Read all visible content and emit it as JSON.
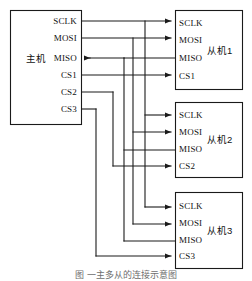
{
  "figure": {
    "caption": "图    一主多从的连接示意图",
    "background_color": "#ffffff",
    "line_color": "#1a1a1a"
  },
  "master": {
    "name": "主机",
    "pins": [
      {
        "id": "sclk",
        "label": "SCLK",
        "direction": "out"
      },
      {
        "id": "mosi",
        "label": "MOSI",
        "direction": "out"
      },
      {
        "id": "miso",
        "label": "MISO",
        "direction": "in"
      },
      {
        "id": "cs1",
        "label": "CS1",
        "direction": "out"
      },
      {
        "id": "cs2",
        "label": "CS2",
        "direction": "out"
      },
      {
        "id": "cs3",
        "label": "CS3",
        "direction": "out"
      }
    ]
  },
  "slaves": [
    {
      "id": "slave1",
      "name": "从机1",
      "pins": [
        {
          "id": "sclk",
          "label": "SCLK",
          "direction": "in"
        },
        {
          "id": "mosi",
          "label": "MOSI",
          "direction": "in"
        },
        {
          "id": "miso",
          "label": "MISO",
          "direction": "out"
        },
        {
          "id": "cs",
          "label": "CS1",
          "direction": "in"
        }
      ]
    },
    {
      "id": "slave2",
      "name": "从机2",
      "pins": [
        {
          "id": "sclk",
          "label": "SCLK",
          "direction": "in"
        },
        {
          "id": "mosi",
          "label": "MOSI",
          "direction": "in"
        },
        {
          "id": "miso",
          "label": "MISO",
          "direction": "out"
        },
        {
          "id": "cs",
          "label": "CS2",
          "direction": "in"
        }
      ]
    },
    {
      "id": "slave3",
      "name": "从机3",
      "pins": [
        {
          "id": "sclk",
          "label": "SCLK",
          "direction": "in"
        },
        {
          "id": "mosi",
          "label": "MOSI",
          "direction": "in"
        },
        {
          "id": "miso",
          "label": "MISO",
          "direction": "out"
        },
        {
          "id": "cs",
          "label": "CS3",
          "direction": "in"
        }
      ]
    }
  ],
  "buses": [
    {
      "id": "sclk-bus",
      "label": "SCLK",
      "from": "master.sclk",
      "to": [
        "slave1.sclk",
        "slave2.sclk",
        "slave3.sclk"
      ]
    },
    {
      "id": "mosi-bus",
      "label": "MOSI",
      "from": "master.mosi",
      "to": [
        "slave1.mosi",
        "slave2.mosi",
        "slave3.mosi"
      ]
    },
    {
      "id": "miso-bus",
      "label": "MISO",
      "from": [
        "slave1.miso",
        "slave2.miso",
        "slave3.miso"
      ],
      "to": "master.miso"
    },
    {
      "id": "cs1-line",
      "label": "CS1",
      "from": "master.cs1",
      "to": [
        "slave1.cs"
      ]
    },
    {
      "id": "cs2-line",
      "label": "CS2",
      "from": "master.cs2",
      "to": [
        "slave2.cs"
      ]
    },
    {
      "id": "cs3-line",
      "label": "CS3",
      "from": "master.cs3",
      "to": [
        "slave3.cs"
      ]
    }
  ]
}
